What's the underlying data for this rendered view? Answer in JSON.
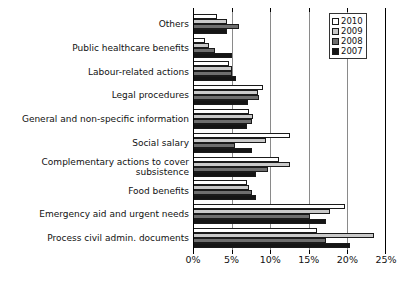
{
  "chart_data": {
    "type": "bar",
    "orientation": "horizontal",
    "title": "",
    "xlabel": "",
    "ylabel": "",
    "xlim": [
      0,
      25
    ],
    "xunit": "%",
    "grid": true,
    "gridlines_x": [
      5,
      10,
      15,
      20
    ],
    "xticks": [
      0,
      5,
      10,
      15,
      20,
      25
    ],
    "xticklabels": [
      "0%",
      "5%",
      "10%",
      "15%",
      "20%",
      "25%"
    ],
    "legend_position": "top-right",
    "categories": [
      "Others",
      "Public healthcare benefits",
      "Labour-related actions",
      "Legal procedures",
      "General and non-specific information",
      "Social salary",
      "Complementary actions to cover subsistence",
      "Food benefits",
      "Emergency aid and urgent needs",
      "Process civil admin. documents"
    ],
    "series": [
      {
        "name": "2010",
        "color": "#ffffff",
        "values": [
          3.1,
          1.5,
          4.6,
          9.1,
          7.3,
          12.5,
          11.2,
          7.0,
          19.7,
          16.0
        ]
      },
      {
        "name": "2009",
        "color": "#c9c9c9",
        "values": [
          4.4,
          2.1,
          5.0,
          8.4,
          7.8,
          9.5,
          12.5,
          7.2,
          17.8,
          23.4
        ]
      },
      {
        "name": "2008",
        "color": "#6e6e6e",
        "values": [
          6.0,
          2.8,
          5.1,
          8.6,
          7.6,
          5.4,
          9.7,
          7.7,
          15.2,
          17.2
        ]
      },
      {
        "name": "2007",
        "color": "#151515",
        "values": [
          4.4,
          5.1,
          5.6,
          7.1,
          7.0,
          7.6,
          8.2,
          8.2,
          17.2,
          20.4
        ]
      }
    ]
  },
  "legend": {
    "items": [
      {
        "label": "2010",
        "swatch": "s2010"
      },
      {
        "label": "2009",
        "swatch": "s2009"
      },
      {
        "label": "2008",
        "swatch": "s2008"
      },
      {
        "label": "2007",
        "swatch": "s2007"
      }
    ]
  }
}
